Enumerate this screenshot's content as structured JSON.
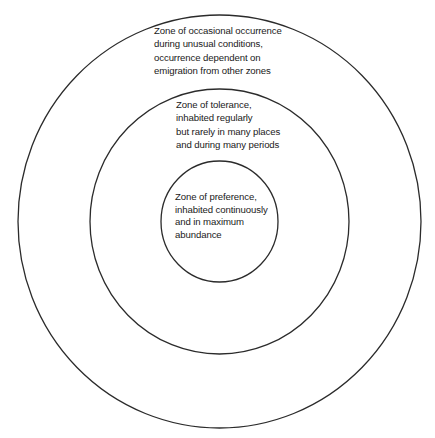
{
  "diagram": {
    "type": "concentric-circles",
    "stroke_color": "#2b2b2b",
    "background_color": "#ffffff",
    "zones": [
      {
        "id": "outer",
        "name": "Zone of occasional occurrence",
        "lines": [
          "Zone of occasional occurrence",
          "during unusual conditions,",
          "occurrence dependent on",
          "emigration from other zones"
        ]
      },
      {
        "id": "middle",
        "name": "Zone of tolerance",
        "lines": [
          "Zone of tolerance,",
          "inhabited regularly",
          "but rarely in many places",
          "and during many periods"
        ]
      },
      {
        "id": "inner",
        "name": "Zone of preference",
        "lines": [
          "Zone of preference,",
          "inhabited continuously",
          "and in maximum",
          "abundance"
        ]
      }
    ]
  }
}
